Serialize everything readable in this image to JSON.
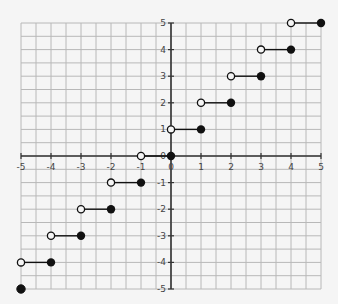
{
  "chart_data": {
    "type": "scatter",
    "title": "",
    "subtitle": "Step function graph (greatest-integer / ceiling-like): open circle at left end, closed dot at right end of each unit segment",
    "xlabel": "",
    "ylabel": "",
    "xlim": [
      -5,
      5
    ],
    "ylim": [
      -5,
      5
    ],
    "grid": true,
    "grid_minor_step": 0.5,
    "x_ticks": [
      "-5",
      "-4",
      "-3",
      "-2",
      "-1",
      "0",
      "1",
      "2",
      "3",
      "4",
      "5"
    ],
    "y_ticks": [
      "5",
      "4",
      "3",
      "2",
      "1",
      "0",
      "-1",
      "-2",
      "-3",
      "-4",
      "-5"
    ],
    "segments": [
      {
        "x_open": -5,
        "x_closed": -4,
        "y": -4
      },
      {
        "x_open": -4,
        "x_closed": -3,
        "y": -3
      },
      {
        "x_open": -3,
        "x_closed": -2,
        "y": -2
      },
      {
        "x_open": -2,
        "x_closed": -1,
        "y": -1
      },
      {
        "x_open": -1,
        "x_closed": 0,
        "y": 0
      },
      {
        "x_open": 0,
        "x_closed": 1,
        "y": 1
      },
      {
        "x_open": 1,
        "x_closed": 2,
        "y": 2
      },
      {
        "x_open": 2,
        "x_closed": 3,
        "y": 3
      },
      {
        "x_open": 3,
        "x_closed": 4,
        "y": 4
      },
      {
        "x_open": 4,
        "x_closed": 5,
        "y": 5
      }
    ],
    "isolated_points": [
      {
        "x": -5,
        "y": -5,
        "filled": true
      }
    ],
    "colors": {
      "grid": "#b8b8b8",
      "axis": "#333333",
      "point": "#111111",
      "background": "#f5f5f5"
    }
  }
}
